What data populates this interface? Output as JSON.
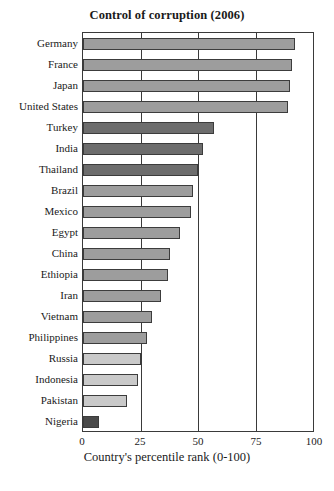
{
  "chart_data": {
    "type": "bar",
    "orientation": "horizontal",
    "title": "Control of corruption (2006)",
    "xlabel": "Country's percentile rank (0-100)",
    "ylabel": "",
    "xlim": [
      0,
      100
    ],
    "xticks": [
      0,
      25,
      50,
      75,
      100
    ],
    "grid": true,
    "legend": false,
    "categories": [
      "Germany",
      "France",
      "Japan",
      "United States",
      "Turkey",
      "India",
      "Thailand",
      "Brazil",
      "Mexico",
      "Egypt",
      "China",
      "Ethiopia",
      "Iran",
      "Vietnam",
      "Philippines",
      "Russia",
      "Indonesia",
      "Pakistan",
      "Nigeria"
    ],
    "values": [
      92,
      91,
      90,
      89,
      57,
      52,
      50,
      48,
      47,
      42,
      38,
      37,
      34,
      30,
      28,
      25,
      24,
      19,
      7
    ],
    "bar_colors": [
      "#9d9d9d",
      "#9d9d9d",
      "#9d9d9d",
      "#9d9d9d",
      "#6d6d6d",
      "#6d6d6d",
      "#6d6d6d",
      "#9d9d9d",
      "#9d9d9d",
      "#9d9d9d",
      "#9d9d9d",
      "#9d9d9d",
      "#9d9d9d",
      "#9d9d9d",
      "#9d9d9d",
      "#c9c9c9",
      "#c9c9c9",
      "#c9c9c9",
      "#4a4a4a"
    ],
    "axis_color": "#3a3a3a",
    "bar_edge_color": "#3c3c3c",
    "background": "#ffffff"
  },
  "footer": {
    "cut_off_line": ""
  }
}
